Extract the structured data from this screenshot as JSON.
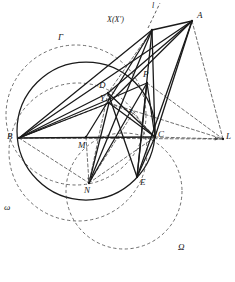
{
  "figure": {
    "kind": "geometry-diagram",
    "width": 235,
    "height": 282,
    "background_color": "#ffffff",
    "stroke_color": "#1a1a1a",
    "dash_color": "#4a4a4a"
  },
  "labels": {
    "A": "A",
    "B": "B",
    "C": "C",
    "D": "D",
    "E": "E",
    "L": "L",
    "M": "M",
    "N": "N",
    "P": "P",
    "Y": "Y",
    "x_small": "x",
    "X": "X(X′)",
    "line_l": "l",
    "Gamma": "Γ",
    "omega": "ω",
    "Omega": "Ω"
  },
  "points": {
    "A": {
      "x": 192,
      "y": 21,
      "label_x": 197,
      "label_y": 11
    },
    "B": {
      "x": 19,
      "y": 138,
      "label_x": 7,
      "label_y": 132
    },
    "C": {
      "x": 155,
      "y": 137,
      "label_x": 158,
      "label_y": 130
    },
    "D": {
      "x": 108,
      "y": 93,
      "label_x": 99,
      "label_y": 81
    },
    "E": {
      "x": 137,
      "y": 177,
      "label_x": 140,
      "label_y": 178
    },
    "L": {
      "x": 223,
      "y": 139,
      "label_x": 226,
      "label_y": 132
    },
    "M": {
      "x": 86,
      "y": 137,
      "label_x": 78,
      "label_y": 141
    },
    "N": {
      "x": 89,
      "y": 183,
      "label_x": 84,
      "label_y": 186
    },
    "P": {
      "x": 147,
      "y": 83,
      "label_x": 143,
      "label_y": 70
    },
    "Y": {
      "x": 109,
      "y": 103,
      "label_x": 100,
      "label_y": 94
    },
    "X": {
      "x": 152,
      "y": 30,
      "label_x": 107,
      "label_y": 16
    },
    "xs": {
      "x": 133,
      "y": 113,
      "label_x": 129,
      "label_y": 107
    }
  },
  "circles": [
    {
      "name": "circumcircle-BC",
      "cx": 86,
      "cy": 131,
      "r": 69,
      "style": "solid"
    },
    {
      "name": "Gamma",
      "cx": 76,
      "cy": 115,
      "r": 70,
      "style": "dashed",
      "label_x": 58,
      "label_y": 33
    },
    {
      "name": "omega",
      "cx": 78,
      "cy": 152,
      "r": 69,
      "style": "dashed",
      "label_x": 4,
      "label_y": 203
    },
    {
      "name": "Omega",
      "cx": 124,
      "cy": 191,
      "r": 58,
      "style": "dashed",
      "label_x": 178,
      "label_y": 243
    }
  ],
  "line_l": {
    "x1": 148,
    "y1": 28,
    "x2": 160,
    "y2": 3,
    "label_x": 152,
    "label_y": 2
  },
  "solid_segments": [
    {
      "name": "BC",
      "from": "B",
      "to": "C"
    },
    {
      "name": "BA",
      "from": "B",
      "to": "A"
    },
    {
      "name": "CA",
      "from": "C",
      "to": "A"
    },
    {
      "name": "BX",
      "from": "B",
      "to": "X"
    },
    {
      "name": "CX",
      "from": "C",
      "to": "X"
    },
    {
      "name": "AX",
      "from": "X",
      "to": "A"
    },
    {
      "name": "XE",
      "from": "X",
      "to": "E"
    },
    {
      "name": "XM",
      "from": "X",
      "to": "M"
    },
    {
      "name": "XN",
      "from": "X",
      "to": "N"
    },
    {
      "name": "BP",
      "from": "B",
      "to": "P"
    },
    {
      "name": "PC",
      "from": "P",
      "to": "C"
    },
    {
      "name": "PE",
      "from": "P",
      "to": "E"
    },
    {
      "name": "PN",
      "from": "P",
      "to": "N"
    },
    {
      "name": "BD",
      "from": "B",
      "to": "D"
    },
    {
      "name": "DC",
      "from": "D",
      "to": "C"
    },
    {
      "name": "DE",
      "from": "D",
      "to": "E"
    },
    {
      "name": "DA",
      "from": "D",
      "to": "A"
    },
    {
      "name": "YC",
      "from": "Y",
      "to": "C"
    },
    {
      "name": "YA",
      "from": "Y",
      "to": "A"
    },
    {
      "name": "YN",
      "from": "Y",
      "to": "N"
    },
    {
      "name": "BY",
      "from": "B",
      "to": "Y"
    },
    {
      "name": "EC",
      "from": "E",
      "to": "C"
    },
    {
      "name": "AC2",
      "from": "A",
      "to": "E"
    }
  ],
  "dashed_segments": [
    {
      "name": "CL",
      "from": "C",
      "to": "L"
    },
    {
      "name": "AL",
      "from": "A",
      "to": "L"
    },
    {
      "name": "PL",
      "from": "P",
      "to": "L"
    },
    {
      "name": "YL",
      "from": "Y",
      "to": "L"
    },
    {
      "name": "BL",
      "from": "B",
      "to": "L"
    },
    {
      "name": "BN",
      "from": "B",
      "to": "N"
    },
    {
      "name": "NC",
      "from": "N",
      "to": "C"
    },
    {
      "name": "MN",
      "from": "M",
      "to": "N"
    },
    {
      "name": "DY",
      "from": "D",
      "to": "Y"
    },
    {
      "name": "DN",
      "from": "D",
      "to": "N"
    },
    {
      "name": "XD",
      "from": "X",
      "to": "D"
    },
    {
      "name": "YX",
      "from": "Y",
      "to": "xs"
    },
    {
      "name": "xsN",
      "from": "xs",
      "to": "N"
    },
    {
      "name": "xsC",
      "from": "xs",
      "to": "C"
    },
    {
      "name": "BM_dash",
      "from": "B",
      "to": "Y"
    }
  ]
}
